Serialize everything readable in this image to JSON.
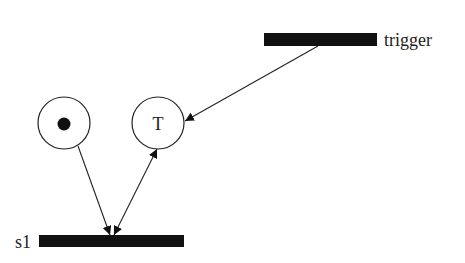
{
  "diagram": {
    "type": "petri-net",
    "colors": {
      "stroke": "#222222",
      "fill": "#111111",
      "background": "#ffffff"
    },
    "places": [
      {
        "id": "p1",
        "cx": 64,
        "cy": 123,
        "r": 26,
        "tokens": 1,
        "label": ""
      },
      {
        "id": "p2",
        "cx": 158,
        "cy": 123,
        "r": 26,
        "tokens": 0,
        "label": "T"
      }
    ],
    "transitions": [
      {
        "id": "trigger",
        "x": 264,
        "y": 33,
        "w": 113,
        "h": 13,
        "label": "trigger"
      },
      {
        "id": "s1",
        "x": 39,
        "y": 235,
        "w": 145,
        "h": 12,
        "label": "s1"
      }
    ],
    "arcs": [
      {
        "from": "trigger",
        "to": "p2",
        "bidirectional": false
      },
      {
        "from": "p1",
        "to": "s1",
        "bidirectional": false
      },
      {
        "from": "p2",
        "to": "s1",
        "bidirectional": true
      }
    ]
  }
}
